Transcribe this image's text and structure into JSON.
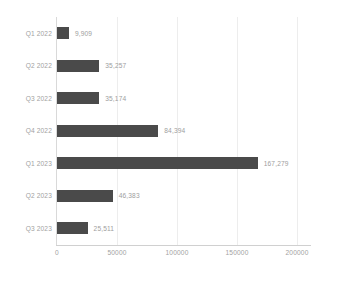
{
  "chart_data": {
    "type": "bar",
    "orientation": "horizontal",
    "title": "",
    "subtitle": "",
    "xlabel": "",
    "ylabel": "",
    "categories": [
      "Q1 2022",
      "Q2 2022",
      "Q3 2022",
      "Q4 2022",
      "Q1 2023",
      "Q2 2023",
      "Q3 2023"
    ],
    "values": [
      9909,
      35257,
      35174,
      84394,
      167279,
      46383,
      25511
    ],
    "value_labels": [
      "9,909",
      "35,257",
      "35,174",
      "84,394",
      "167,279",
      "46,383",
      "25,511"
    ],
    "xlim": [
      0,
      200000
    ],
    "xticks": [
      0,
      50000,
      100000,
      150000,
      200000
    ],
    "xtick_labels": [
      "0",
      "50000",
      "100000",
      "150000",
      "200000"
    ],
    "grid": {
      "vertical": true,
      "horizontal": false
    },
    "legend": null,
    "colors": {
      "bar": "#4a4a4a",
      "gridline": "#ededed",
      "axis": "#d9d9d9",
      "tick_text": "#a2a2a2",
      "value_text": "#9e9e9e",
      "background": "#ffffff"
    }
  }
}
